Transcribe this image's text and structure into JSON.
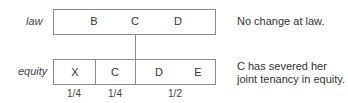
{
  "law": {
    "label": "law",
    "holders": [
      "B",
      "C",
      "D"
    ],
    "note": "No change at law."
  },
  "equity": {
    "label": "equity",
    "holders": [
      "X",
      "C",
      "D",
      "E"
    ],
    "shares": [
      "1/4",
      "1/4",
      "1/2"
    ],
    "note_line1": "C has severed her",
    "note_line2": "joint tenancy in equity."
  }
}
